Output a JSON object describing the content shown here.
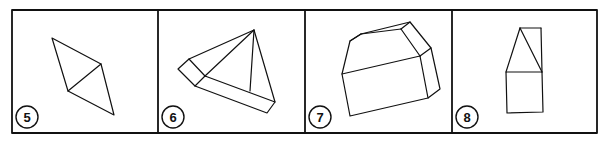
{
  "figure": {
    "stroke_color": "#111111",
    "background": "#ffffff",
    "panels": [
      {
        "label": "5",
        "shape": "rhombus split by diagonal into two triangles"
      },
      {
        "label": "6",
        "shape": "triangular pyramid with rectangular prism base edge"
      },
      {
        "label": "7",
        "shape": "box with beveled top edge"
      },
      {
        "label": "8",
        "shape": "triangle atop rectangle with side strip"
      }
    ]
  }
}
